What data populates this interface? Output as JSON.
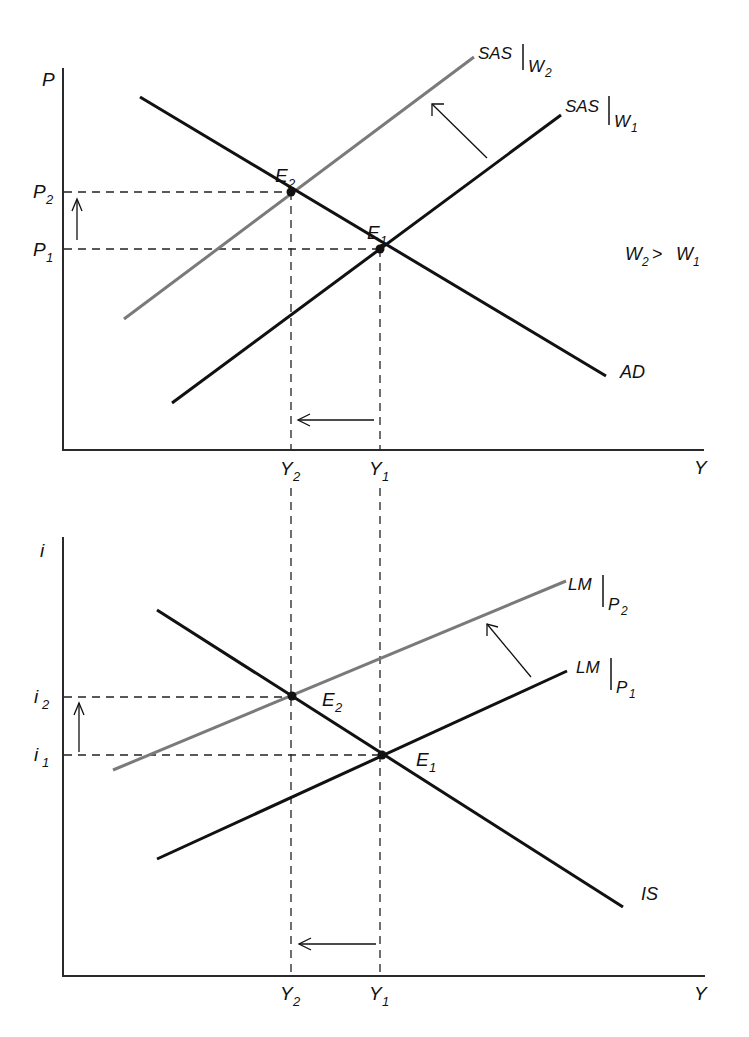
{
  "colors": {
    "black_curve": "#111111",
    "gray_curve": "#7a7a7a",
    "background": "#ffffff"
  },
  "top_panel": {
    "y_axis_label": "P",
    "x_axis_label": "Y",
    "y_ticks": [
      {
        "main": "P",
        "sub": "2"
      },
      {
        "main": "P",
        "sub": "1"
      }
    ],
    "x_ticks": [
      {
        "main": "Y",
        "sub": "2"
      },
      {
        "main": "Y",
        "sub": "1"
      }
    ],
    "curves": {
      "sas_w2": {
        "main": "SAS",
        "sub": "W",
        "subsub": "2"
      },
      "sas_w1": {
        "main": "SAS",
        "sub": "W",
        "subsub": "1"
      },
      "ad": {
        "main": "AD"
      }
    },
    "points": {
      "e2": {
        "main": "E",
        "sub": "2"
      },
      "e1": {
        "main": "E",
        "sub": "1"
      }
    },
    "annotation": {
      "w2": "W",
      "w2_sub": "2",
      "gt": ">",
      "w1": "W",
      "w1_sub": "1"
    }
  },
  "bottom_panel": {
    "y_axis_label": "i",
    "x_axis_label": "Y",
    "y_ticks": [
      {
        "main": "i",
        "sub": "2"
      },
      {
        "main": "i",
        "sub": "1"
      }
    ],
    "x_ticks": [
      {
        "main": "Y",
        "sub": "2"
      },
      {
        "main": "Y",
        "sub": "1"
      }
    ],
    "curves": {
      "lm_p2": {
        "main": "LM",
        "sub": "P",
        "subsub": "2"
      },
      "lm_p1": {
        "main": "LM",
        "sub": "P",
        "subsub": "1"
      },
      "is": {
        "main": "IS"
      }
    },
    "points": {
      "e2": {
        "main": "E",
        "sub": "2"
      },
      "e1": {
        "main": "E",
        "sub": "1"
      }
    }
  }
}
